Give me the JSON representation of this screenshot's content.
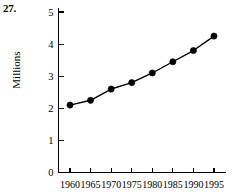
{
  "figure": {
    "problem_number": "27.",
    "y_axis_label": "Millions"
  },
  "chart_data": {
    "type": "line",
    "title": "",
    "xlabel": "",
    "ylabel": "Millions",
    "categories": [
      "1960",
      "1965",
      "1970",
      "1975",
      "1980",
      "1985",
      "1990",
      "1995"
    ],
    "x": [
      1960,
      1965,
      1970,
      1975,
      1980,
      1985,
      1990,
      1995
    ],
    "values": [
      2.1,
      2.25,
      2.6,
      2.8,
      3.1,
      3.45,
      3.8,
      4.25
    ],
    "series": [
      {
        "name": "Millions",
        "values": [
          2.1,
          2.25,
          2.6,
          2.8,
          3.1,
          3.45,
          3.8,
          4.25
        ]
      }
    ],
    "y_ticks": [
      0,
      1,
      2,
      3,
      4,
      5
    ],
    "y_tick_labels": [
      "0",
      "1",
      "2",
      "3",
      "4",
      "5"
    ],
    "x_tick_labels": [
      "1960",
      "1965",
      "1970",
      "1975",
      "1980",
      "1985",
      "1990",
      "1995"
    ],
    "ylim": [
      0,
      5
    ],
    "xlim": [
      1960,
      1995
    ],
    "grid": false,
    "legend": false,
    "marker": "filled-circle",
    "line_color": "#000000",
    "marker_color": "#000000",
    "background_color": "#ffffff"
  }
}
